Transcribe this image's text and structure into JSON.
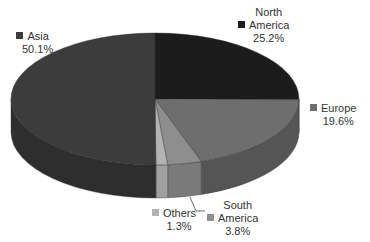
{
  "chart_data": {
    "type": "pie",
    "style": "3d",
    "title": "",
    "legend": "none",
    "slices": [
      {
        "label": "North America",
        "value": 25.2,
        "display": "25.2%",
        "color": "#1c1c1c",
        "side": "#141414"
      },
      {
        "label": "Europe",
        "value": 19.6,
        "display": "19.6%",
        "color": "#6e6e6e",
        "side": "#555555"
      },
      {
        "label": "South America",
        "value": 3.8,
        "display": "3.8%",
        "color": "#8e8e8e",
        "side": "#7a7a7a"
      },
      {
        "label": "Others",
        "value": 1.3,
        "display": "1.3%",
        "color": "#b3b3b3",
        "side": "#a0a0a0"
      },
      {
        "label": "Asia",
        "value": 50.1,
        "display": "50.1%",
        "color": "#3c3c3c",
        "side": "#2e2e2e"
      }
    ]
  },
  "labels": {
    "asia": {
      "line1": "Asia",
      "line2": "50.1%"
    },
    "north_america": {
      "line1": "North",
      "line2": "America",
      "line3": "25.2%"
    },
    "europe": {
      "line1": "Europe",
      "line2": "19.6%"
    },
    "others": {
      "line1": "Others",
      "line2": "1.3%"
    },
    "south_america": {
      "line1": "South",
      "line2": "America",
      "line3": "3.8%"
    }
  }
}
